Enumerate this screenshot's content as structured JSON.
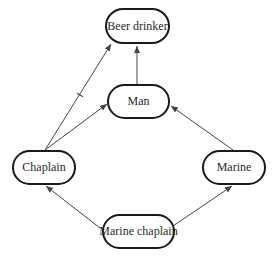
{
  "diagram": {
    "type": "inheritance-network",
    "colors": {
      "line": "#444444",
      "node_border": "#1a1a1a",
      "text": "#2a2a2a",
      "background": "#ffffff"
    },
    "nodes": [
      {
        "id": "beer_drinker",
        "label": "Beer drinker",
        "x": 105,
        "y": 8,
        "w": 65,
        "h": 36
      },
      {
        "id": "man",
        "label": "Man",
        "x": 107,
        "y": 84,
        "w": 63,
        "h": 35
      },
      {
        "id": "chaplain",
        "label": "Chaplain",
        "x": 12,
        "y": 150,
        "w": 64,
        "h": 35
      },
      {
        "id": "marine",
        "label": "Marine",
        "x": 202,
        "y": 150,
        "w": 64,
        "h": 35
      },
      {
        "id": "marine_chaplain",
        "label": "Marine chaplain",
        "x": 102,
        "y": 214,
        "w": 73,
        "h": 35
      }
    ],
    "edges": [
      {
        "from": "man",
        "to": "beer_drinker",
        "x1": 137,
        "y1": 84,
        "x2": 137,
        "y2": 46,
        "cancelled": false
      },
      {
        "from": "chaplain",
        "to": "beer_drinker",
        "x1": 45,
        "y1": 150,
        "x2": 111,
        "y2": 44,
        "cancelled": true,
        "mark_at": [
          80,
          95
        ]
      },
      {
        "from": "chaplain",
        "to": "man",
        "x1": 45,
        "y1": 150,
        "x2": 107,
        "y2": 104,
        "cancelled": false
      },
      {
        "from": "marine",
        "to": "man",
        "x1": 233,
        "y1": 150,
        "x2": 171,
        "y2": 106,
        "cancelled": false
      },
      {
        "from": "marine_chaplain",
        "to": "chaplain",
        "x1": 100,
        "y1": 228,
        "x2": 46,
        "y2": 186,
        "cancelled": false
      },
      {
        "from": "marine_chaplain",
        "to": "marine",
        "x1": 173,
        "y1": 226,
        "x2": 232,
        "y2": 186,
        "cancelled": false
      }
    ]
  }
}
